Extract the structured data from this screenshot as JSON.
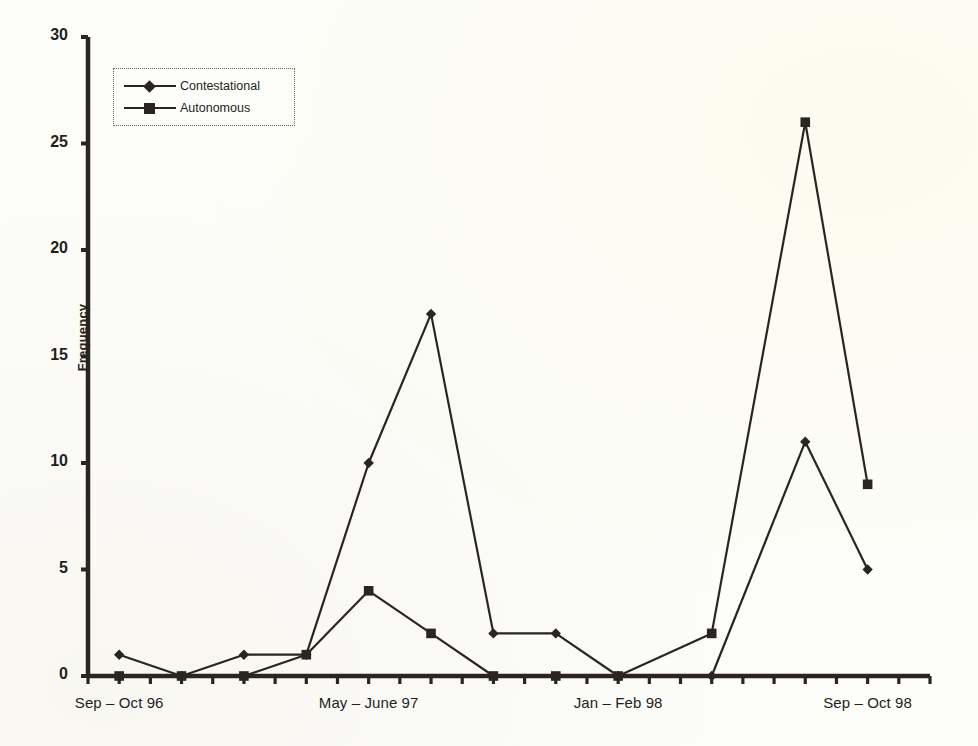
{
  "chart_data": {
    "type": "line",
    "title": "",
    "subtitle": "",
    "xlabel": "",
    "ylabel": "Frequency",
    "ylim": [
      0,
      30
    ],
    "yticks": [
      0,
      5,
      10,
      15,
      20,
      25,
      30
    ],
    "grid": false,
    "legend_position": "upper-left",
    "x_tick_count": 28,
    "x_axis_labels": [
      {
        "index": 1,
        "text": "Sep – Oct 96"
      },
      {
        "index": 9,
        "text": "May – June 97"
      },
      {
        "index": 17,
        "text": "Jan – Feb 98"
      },
      {
        "index": 25,
        "text": "Sep – Oct 98"
      }
    ],
    "x": [
      0,
      1,
      2,
      3,
      4,
      5,
      6,
      7,
      8,
      9,
      10,
      11,
      12,
      13,
      14,
      15,
      16,
      17,
      18,
      19,
      20,
      21,
      22,
      23,
      24,
      25,
      26,
      27
    ],
    "categories": [
      "Jul – Aug 96",
      "Sep – Oct 96",
      "Nov – Dec 96",
      "Jan – Feb 97",
      "Mar – Apr 97",
      "May – June 97",
      "Jul – Aug 97",
      "Sep – Oct 97",
      "Nov – Dec 97",
      "Jan – Feb 98",
      "Mar – Apr 98",
      "May – June 98",
      "Jul – Aug 98",
      "Sep – Oct 98",
      "Nov – Dec 98",
      "P15",
      "P16",
      "P17",
      "P18",
      "P19",
      "P20",
      "P21",
      "P22",
      "P23",
      "P24",
      "P25",
      "P26",
      "P27"
    ],
    "series": [
      {
        "name": "Contestational",
        "marker": "diamond",
        "color": "#2b2521",
        "points": [
          {
            "x": 1,
            "y": 1
          },
          {
            "x": 3,
            "y": 0
          },
          {
            "x": 5,
            "y": 1
          },
          {
            "x": 7,
            "y": 1
          },
          {
            "x": 9,
            "y": 10
          },
          {
            "x": 11,
            "y": 17
          },
          {
            "x": 13,
            "y": 2
          },
          {
            "x": 15,
            "y": 2
          },
          {
            "x": 17,
            "y": 0
          },
          {
            "x": 20,
            "y": 0
          },
          {
            "x": 23,
            "y": 11
          },
          {
            "x": 25,
            "y": 5
          }
        ]
      },
      {
        "name": "Autonomous",
        "marker": "square",
        "color": "#2b2521",
        "points": [
          {
            "x": 1,
            "y": 0
          },
          {
            "x": 3,
            "y": 0
          },
          {
            "x": 5,
            "y": 0
          },
          {
            "x": 7,
            "y": 1
          },
          {
            "x": 9,
            "y": 4
          },
          {
            "x": 11,
            "y": 2
          },
          {
            "x": 13,
            "y": 0
          },
          {
            "x": 15,
            "y": 0
          },
          {
            "x": 17,
            "y": 0
          },
          {
            "x": 20,
            "y": 2
          },
          {
            "x": 23,
            "y": 26
          },
          {
            "x": 25,
            "y": 9
          }
        ]
      }
    ],
    "legend": [
      {
        "label": "Contestational",
        "marker": "diamond"
      },
      {
        "label": "Autonomous",
        "marker": "square"
      }
    ]
  },
  "axis": {
    "y_title": "Frequency",
    "y_tick_labels": [
      "30",
      "25",
      "20",
      "15",
      "10",
      "5",
      "0"
    ]
  }
}
